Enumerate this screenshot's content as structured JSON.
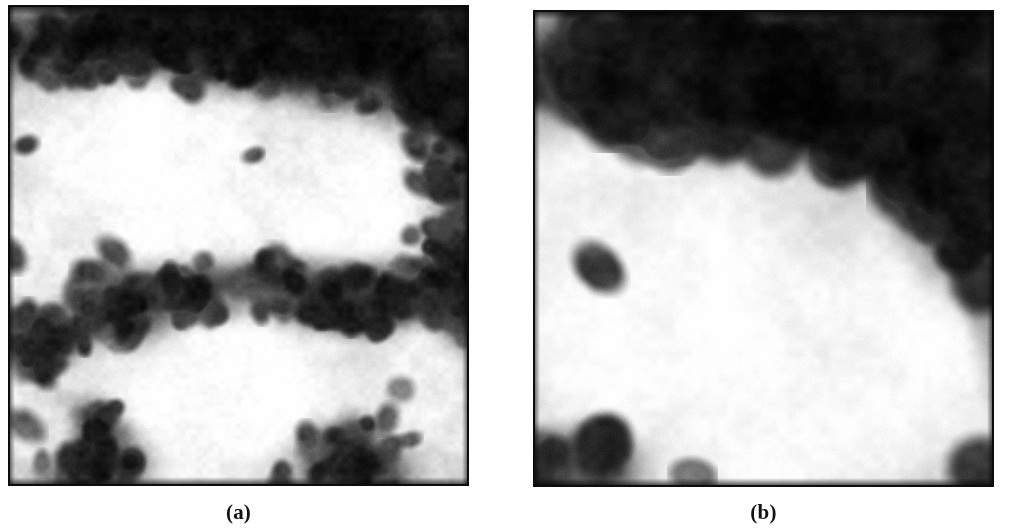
{
  "figure": {
    "kind": "micrograph-pair",
    "background_color": "#ffffff",
    "width": 1009,
    "height": 529,
    "panels": [
      {
        "id": "a",
        "caption": "(a)",
        "x": 8,
        "y": 5,
        "width": 461,
        "height": 481,
        "border_color": "#0d0d0d",
        "border_width": 2,
        "description": "Grayscale electron micrograph of a granular nanoparticle film. Fine sub-20 px grains form bright plateau regions separated by dark interconnected networks of aggregated dark particles.",
        "grain_size_px": 17,
        "grain_softness": 0.55,
        "base_level": 0.86,
        "noise_amount": 0.12,
        "dark_particles": 430,
        "dark_particle_radius": [
          7,
          14
        ],
        "bright_domains": [
          {
            "cx": 0.3,
            "cy": 0.35,
            "rx": 0.25,
            "ry": 0.2,
            "level": 1.0
          },
          {
            "cx": 0.74,
            "cy": 0.38,
            "rx": 0.2,
            "ry": 0.17,
            "level": 0.98
          },
          {
            "cx": 0.47,
            "cy": 0.8,
            "rx": 0.24,
            "ry": 0.18,
            "level": 1.0
          },
          {
            "cx": 0.07,
            "cy": 0.52,
            "rx": 0.12,
            "ry": 0.14,
            "level": 0.92
          },
          {
            "cx": 0.9,
            "cy": 0.82,
            "rx": 0.12,
            "ry": 0.13,
            "level": 0.9
          },
          {
            "cx": 0.06,
            "cy": 0.87,
            "rx": 0.09,
            "ry": 0.1,
            "level": 0.88
          }
        ],
        "dark_bands": [
          {
            "cx": 0.55,
            "cy": 0.07,
            "rx": 0.6,
            "ry": 0.11,
            "level": 0.08
          },
          {
            "cx": 0.88,
            "cy": 0.22,
            "rx": 0.2,
            "ry": 0.22,
            "level": 0.1
          },
          {
            "cx": 0.3,
            "cy": 0.62,
            "rx": 0.26,
            "ry": 0.09,
            "level": 0.12
          },
          {
            "cx": 0.72,
            "cy": 0.6,
            "rx": 0.26,
            "ry": 0.08,
            "level": 0.16
          },
          {
            "cx": 0.06,
            "cy": 0.66,
            "rx": 0.11,
            "ry": 0.09,
            "level": 0.14
          },
          {
            "cx": 0.17,
            "cy": 0.92,
            "rx": 0.14,
            "ry": 0.09,
            "level": 0.18
          },
          {
            "cx": 0.75,
            "cy": 0.93,
            "rx": 0.16,
            "ry": 0.08,
            "level": 0.22
          },
          {
            "cx": 0.98,
            "cy": 0.5,
            "rx": 0.08,
            "ry": 0.22,
            "level": 0.18
          }
        ]
      },
      {
        "id": "b",
        "caption": "(b)",
        "x": 533,
        "y": 10,
        "width": 461,
        "height": 477,
        "border_color": "#0d0d0d",
        "border_width": 2,
        "description": "Grayscale electron micrograph of a coarser, more pixelated nanoparticle film. A broad dark aggregated band occupies the upper third and right edge; the lower two thirds is a light mottled plateau with faint round grains.",
        "grain_size_px": 26,
        "grain_softness": 0.3,
        "base_level": 0.82,
        "noise_amount": 0.1,
        "dark_particles": 150,
        "dark_particle_radius": [
          13,
          30
        ],
        "bright_domains": [
          {
            "cx": 0.3,
            "cy": 0.62,
            "rx": 0.33,
            "ry": 0.27,
            "level": 0.99
          },
          {
            "cx": 0.7,
            "cy": 0.72,
            "rx": 0.3,
            "ry": 0.24,
            "level": 0.97
          },
          {
            "cx": 0.13,
            "cy": 0.4,
            "rx": 0.14,
            "ry": 0.14,
            "level": 0.93
          },
          {
            "cx": 0.52,
            "cy": 0.9,
            "rx": 0.26,
            "ry": 0.12,
            "level": 0.95
          }
        ],
        "dark_bands": [
          {
            "cx": 0.6,
            "cy": 0.14,
            "rx": 0.52,
            "ry": 0.16,
            "level": 0.06
          },
          {
            "cx": 0.2,
            "cy": 0.1,
            "rx": 0.22,
            "ry": 0.12,
            "level": 0.22
          },
          {
            "cx": 0.93,
            "cy": 0.3,
            "rx": 0.14,
            "ry": 0.32,
            "level": 0.08
          },
          {
            "cx": 0.88,
            "cy": 0.08,
            "rx": 0.18,
            "ry": 0.12,
            "level": 0.12
          },
          {
            "cx": 0.1,
            "cy": 0.95,
            "rx": 0.14,
            "ry": 0.08,
            "level": 0.35
          },
          {
            "cx": 0.99,
            "cy": 0.62,
            "rx": 0.05,
            "ry": 0.16,
            "level": 0.2
          }
        ]
      }
    ]
  }
}
